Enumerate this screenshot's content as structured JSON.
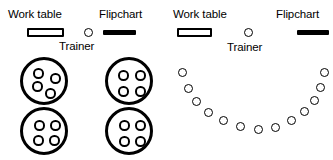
{
  "diagram": {
    "width": 333,
    "height": 160,
    "stroke_color": "#000000",
    "background_color": "#ffffff"
  },
  "layouts": [
    {
      "id": "cabaret-round-tables",
      "labels": {
        "work_table": "Work table",
        "flipchart": "Flipchart",
        "trainer": "Trainer"
      },
      "fixtures": {
        "work_table": {
          "x": 27,
          "y": 28,
          "w": 37,
          "h": 9
        },
        "flipchart": {
          "x": 103,
          "y": 30,
          "w": 33,
          "h": 5
        },
        "trainer_seat": {
          "x": 84,
          "y": 28,
          "d": 9
        }
      },
      "tables": [
        {
          "id": "table-1",
          "seats": 4,
          "cx": 44,
          "cy": 81,
          "chairs": [
            {
              "x": 10,
              "y": 8
            },
            {
              "x": 27,
              "y": 13
            },
            {
              "x": 9,
              "y": 21
            },
            {
              "x": 22,
              "y": 28
            }
          ]
        },
        {
          "id": "table-2",
          "seats": 4,
          "cx": 129,
          "cy": 81,
          "chairs": [
            {
              "x": 10,
              "y": 10
            },
            {
              "x": 27,
              "y": 10
            },
            {
              "x": 10,
              "y": 26
            },
            {
              "x": 27,
              "y": 26
            }
          ]
        },
        {
          "id": "table-3",
          "seats": 4,
          "cx": 44,
          "cy": 131,
          "chairs": [
            {
              "x": 11,
              "y": 10
            },
            {
              "x": 27,
              "y": 10
            },
            {
              "x": 10,
              "y": 25
            },
            {
              "x": 26,
              "y": 25
            }
          ]
        },
        {
          "id": "table-4",
          "seats": 4,
          "cx": 129,
          "cy": 131,
          "chairs": [
            {
              "x": 11,
              "y": 10
            },
            {
              "x": 27,
              "y": 10
            },
            {
              "x": 11,
              "y": 26
            },
            {
              "x": 27,
              "y": 26
            }
          ]
        }
      ],
      "total_seats": 16
    },
    {
      "id": "u-shape-horseshoe",
      "labels": {
        "work_table": "Work table",
        "flipchart": "Flipchart",
        "trainer": "Trainer"
      },
      "fixtures": {
        "work_table": {
          "x": 177,
          "y": 28,
          "w": 35,
          "h": 9
        },
        "flipchart": {
          "x": 297,
          "y": 30,
          "w": 32,
          "h": 5
        },
        "trainer_seat": {
          "x": 244,
          "y": 28,
          "d": 9
        }
      },
      "arc_seats": [
        {
          "x": 178,
          "y": 73
        },
        {
          "x": 184,
          "y": 89
        },
        {
          "x": 192,
          "y": 102
        },
        {
          "x": 204,
          "y": 113
        },
        {
          "x": 219,
          "y": 121
        },
        {
          "x": 236,
          "y": 127
        },
        {
          "x": 254,
          "y": 130
        },
        {
          "x": 271,
          "y": 128
        },
        {
          "x": 287,
          "y": 121
        },
        {
          "x": 300,
          "y": 112
        },
        {
          "x": 310,
          "y": 101
        },
        {
          "x": 316,
          "y": 88
        },
        {
          "x": 320,
          "y": 73
        },
        {
          "x": 245,
          "y": 131
        }
      ],
      "arc_seat_diameter": 9,
      "total_seats": 14
    }
  ]
}
